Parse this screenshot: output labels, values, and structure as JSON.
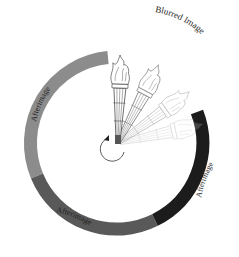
{
  "labels": {
    "blurred": "Blurred Image",
    "afterimage_left": "Afterimage",
    "afterimage_right": "Afterimage",
    "afterimage_bottom": "Afterimage"
  },
  "colors": {
    "ring_light": "#8c8c8c",
    "ring_mid": "#595959",
    "ring_dark": "#1c1c1c",
    "torch_stroke": "#333333"
  }
}
